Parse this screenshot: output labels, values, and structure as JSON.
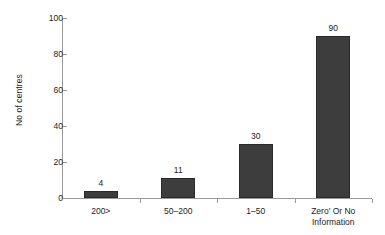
{
  "chart_data": {
    "type": "bar",
    "title": "",
    "xlabel": "",
    "ylabel": "No of centres",
    "categories": [
      "200>",
      "50–200",
      "1–50",
      "Zero' Or No Information"
    ],
    "category_lines": [
      [
        "200>"
      ],
      [
        "50–200"
      ],
      [
        "1–50"
      ],
      [
        "Zero' Or No",
        "Information"
      ]
    ],
    "values": [
      4,
      11,
      30,
      90
    ],
    "value_labels": [
      "4",
      "11",
      "30",
      "90"
    ],
    "ylim": [
      0,
      100
    ],
    "yticks": [
      0,
      20,
      40,
      60,
      80,
      100
    ],
    "ytick_labels": [
      "0",
      "20",
      "40",
      "60",
      "80",
      "100"
    ],
    "grid": false,
    "legend": false,
    "legend_position": "none",
    "bar_color": "#3d3d3d",
    "bar_border_color": "#2a2a2a",
    "axis_color": "#9a9a9a",
    "text_color": "#1c1c1c",
    "background_color": "#ffffff"
  }
}
